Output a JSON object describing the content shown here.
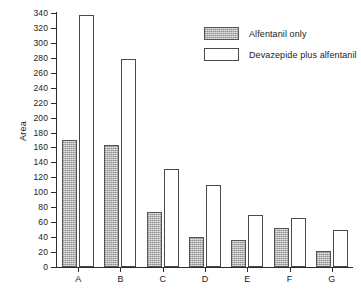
{
  "chart_data": {
    "type": "bar",
    "title": "",
    "xlabel": "",
    "ylabel": "Area",
    "ylim": [
      0,
      340
    ],
    "ytick_step": 20,
    "grid": false,
    "legend_position": "top-right",
    "categories": [
      "A",
      "B",
      "C",
      "D",
      "E",
      "F",
      "G"
    ],
    "yticks": [
      0,
      20,
      40,
      60,
      80,
      100,
      120,
      140,
      160,
      180,
      200,
      220,
      240,
      260,
      280,
      300,
      320,
      340
    ],
    "series": [
      {
        "name": "Alfentanil only",
        "fill": "gray-stipple",
        "color": "#b4b4b4",
        "values": [
          170,
          163,
          73,
          40,
          36,
          52,
          22
        ]
      },
      {
        "name": "Devazepide plus alfentanil",
        "fill": "white",
        "color": "#ffffff",
        "values": [
          338,
          279,
          131,
          110,
          69,
          66,
          50
        ]
      }
    ]
  },
  "axis": {
    "y_title": "Area"
  },
  "legend": {
    "entries": [
      {
        "label": "Alfentanil only"
      },
      {
        "label": "Devazepide plus alfentanil"
      }
    ]
  }
}
